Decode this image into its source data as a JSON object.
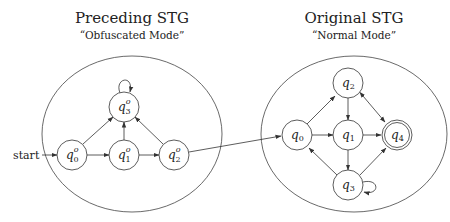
{
  "left_panel": {
    "title": "Preceding STG",
    "subtitle": "“Obfuscated Mode”",
    "start_label": "start",
    "states": [
      {
        "id": "q0o",
        "base": "q",
        "sub": "0",
        "sup": "o"
      },
      {
        "id": "q1o",
        "base": "q",
        "sub": "1",
        "sup": "o"
      },
      {
        "id": "q2o",
        "base": "q",
        "sub": "2",
        "sup": "o"
      },
      {
        "id": "q3o",
        "base": "q",
        "sub": "3",
        "sup": "o"
      }
    ],
    "transitions": [
      [
        "start",
        "q0o"
      ],
      [
        "q0o",
        "q1o"
      ],
      [
        "q1o",
        "q2o"
      ],
      [
        "q0o",
        "q3o"
      ],
      [
        "q1o",
        "q3o"
      ],
      [
        "q2o",
        "q3o"
      ],
      [
        "q3o",
        "q3o"
      ]
    ]
  },
  "right_panel": {
    "title": "Original STG",
    "subtitle": "“Normal Mode”",
    "states": [
      {
        "id": "q0",
        "base": "q",
        "sub": "0"
      },
      {
        "id": "q1",
        "base": "q",
        "sub": "1"
      },
      {
        "id": "q2",
        "base": "q",
        "sub": "2"
      },
      {
        "id": "q3",
        "base": "q",
        "sub": "3"
      },
      {
        "id": "q4",
        "base": "q",
        "sub": "4",
        "accepting": true
      }
    ],
    "transitions": [
      [
        "q0",
        "q2"
      ],
      [
        "q0",
        "q1"
      ],
      [
        "q2",
        "q1"
      ],
      [
        "q1",
        "q4"
      ],
      [
        "q1",
        "q3"
      ],
      [
        "q2",
        "q4"
      ],
      [
        "q4",
        "q2"
      ],
      [
        "q3",
        "q0"
      ],
      [
        "q3",
        "q4"
      ],
      [
        "q3",
        "q3"
      ]
    ]
  },
  "cross_transition": [
    "q2o",
    "q0"
  ]
}
